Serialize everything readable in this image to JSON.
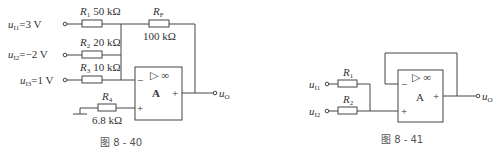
{
  "figure_40": {
    "caption": "图 8 - 40",
    "inputs": [
      {
        "name": "u",
        "sub": "I1",
        "eq": "=3 V",
        "resistor": "R",
        "res_sub": "1",
        "value": "50 kΩ"
      },
      {
        "name": "u",
        "sub": "I2",
        "eq": "=−2 V",
        "resistor": "R",
        "res_sub": "2",
        "value": "20 kΩ"
      },
      {
        "name": "u",
        "sub": "I3",
        "eq": "=1 V",
        "resistor": "R",
        "res_sub": "3",
        "value": "10 kΩ"
      }
    ],
    "feedback": {
      "resistor": "R",
      "res_sub": "F",
      "value": "100 kΩ"
    },
    "ground_resistor": {
      "resistor": "R",
      "res_sub": "4",
      "value": "6.8 kΩ"
    },
    "opamp": {
      "label": "A",
      "symbol": "▷ ∞",
      "minus": "−",
      "plus": "+",
      "out_sign": "+"
    },
    "output": {
      "name": "u",
      "sub": "O"
    }
  },
  "figure_41": {
    "caption": "图 8 - 41",
    "inputs": [
      {
        "name": "u",
        "sub": "I1",
        "resistor": "R",
        "res_sub": "1"
      },
      {
        "name": "u",
        "sub": "I2",
        "resistor": "R",
        "res_sub": "2"
      }
    ],
    "opamp": {
      "label": "A",
      "symbol": "▷ ∞",
      "minus": "−",
      "plus": "+",
      "out_sign": "+"
    },
    "output": {
      "name": "u",
      "sub": "O"
    }
  }
}
